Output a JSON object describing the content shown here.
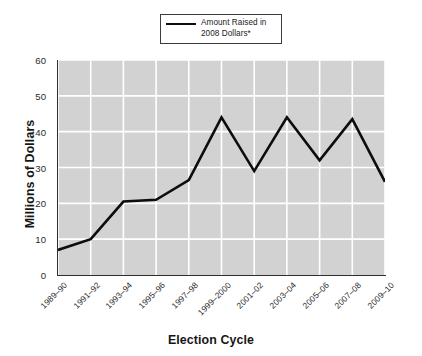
{
  "chart_data": {
    "type": "line",
    "title": "",
    "xlabel": "Election Cycle",
    "ylabel": "Millions of Dollars",
    "categories": [
      "1989–90",
      "1991–92",
      "1993–94",
      "1995–96",
      "1997–98",
      "1999–2000",
      "2001–02",
      "2003–04",
      "2005–06",
      "2007–08",
      "2009–10"
    ],
    "series": [
      {
        "name": "Amount Raised in 2008 Dollars*",
        "values": [
          7,
          10,
          20.5,
          21,
          26.5,
          44,
          29,
          44,
          32,
          43.5,
          26
        ]
      }
    ],
    "ylim": [
      0,
      60
    ],
    "yticks": [
      0,
      10,
      20,
      30,
      40,
      50,
      60
    ],
    "ytick_labels": [
      "0",
      "10",
      "20",
      "30",
      "40",
      "50",
      "60"
    ],
    "grid": true,
    "grid_color": "#ffffff",
    "plot_background": "#d2d2d2",
    "line_color": "#0d0d0d",
    "legend_position": "top-center",
    "legend": {
      "entries": [
        {
          "label_line1": "Amount Raised in",
          "label_line2": "2008 Dollars*",
          "color": "#0d0d0d",
          "marker": "line"
        }
      ]
    }
  },
  "axes": {
    "y_title": "Millions of Dollars",
    "x_title": "Election Cycle"
  }
}
